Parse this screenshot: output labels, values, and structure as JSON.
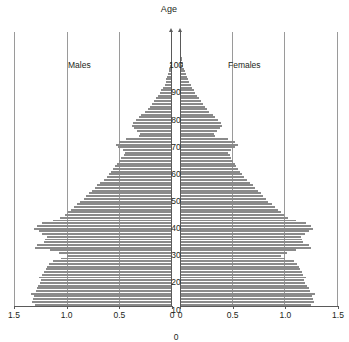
{
  "chart_data": {
    "type": "bar",
    "subtype": "population-pyramid",
    "title": "Age",
    "xlabel": "",
    "ylabel": "Age",
    "grid": true,
    "legend_position": "in-plot",
    "orientation": "horizontal",
    "left_panel_label": "Males",
    "right_panel_label": "Females",
    "xlim_left": [
      1.5,
      0
    ],
    "xlim_right": [
      0,
      1.5
    ],
    "ylim": [
      0,
      100
    ],
    "xticks_left": [
      "1.5",
      "1.0",
      "0.5",
      "0"
    ],
    "xticks_right": [
      "0",
      "0.5",
      "1.0",
      "1.5"
    ],
    "xtick_values_left": [
      1.5,
      1.0,
      0.5,
      0
    ],
    "xtick_values_right": [
      0,
      0.5,
      1.0,
      1.5
    ],
    "yticks": [
      "0",
      "10",
      "20",
      "30",
      "40",
      "50",
      "60",
      "70",
      "80",
      "90",
      "100"
    ],
    "ytick_values": [
      0,
      10,
      20,
      30,
      40,
      50,
      60,
      70,
      80,
      90,
      100
    ],
    "bar_color": "#8a8a8a",
    "axis_color": "#5a5a5a",
    "grid_color": "#9a9a9a",
    "background_color": "#ffffff",
    "ages": [
      0,
      1,
      2,
      3,
      4,
      5,
      6,
      7,
      8,
      9,
      10,
      11,
      12,
      13,
      14,
      15,
      16,
      17,
      18,
      19,
      20,
      21,
      22,
      23,
      24,
      25,
      26,
      27,
      28,
      29,
      30,
      31,
      32,
      33,
      34,
      35,
      36,
      37,
      38,
      39,
      40,
      41,
      42,
      43,
      44,
      45,
      46,
      47,
      48,
      49,
      50,
      51,
      52,
      53,
      54,
      55,
      56,
      57,
      58,
      59,
      60,
      61,
      62,
      63,
      64,
      65,
      66,
      67,
      68,
      69,
      70,
      71,
      72,
      73,
      74,
      75,
      76,
      77,
      78,
      79,
      80,
      81,
      82,
      83,
      84,
      85,
      86,
      87,
      88,
      89,
      90,
      91,
      92,
      93,
      94,
      95,
      96,
      97,
      98,
      99,
      100
    ],
    "series": [
      {
        "name": "Males",
        "side": "left",
        "values": [
          1.3,
          1.33,
          1.32,
          1.31,
          1.34,
          1.29,
          1.28,
          1.27,
          1.25,
          1.24,
          1.26,
          1.23,
          1.22,
          1.2,
          1.19,
          1.17,
          1.13,
          1.05,
          1.0,
          1.07,
          1.16,
          1.3,
          1.28,
          1.22,
          1.21,
          1.19,
          1.23,
          1.26,
          1.31,
          1.28,
          1.23,
          1.13,
          1.06,
          1.02,
          0.99,
          0.96,
          0.93,
          0.9,
          0.87,
          0.84,
          0.82,
          0.79,
          0.76,
          0.73,
          0.71,
          0.68,
          0.65,
          0.62,
          0.6,
          0.58,
          0.56,
          0.54,
          0.52,
          0.5,
          0.48,
          0.46,
          0.45,
          0.47,
          0.51,
          0.53,
          0.5,
          0.44,
          0.31,
          0.3,
          0.33,
          0.36,
          0.38,
          0.37,
          0.34,
          0.31,
          0.29,
          0.26,
          0.23,
          0.21,
          0.19,
          0.17,
          0.15,
          0.13,
          0.11,
          0.1,
          0.09,
          0.07,
          0.06,
          0.055,
          0.05,
          0.04,
          0.03,
          0.025,
          0.02,
          0.015,
          0.012,
          0.01,
          0.008,
          0.006,
          0.005,
          0.004,
          0.003,
          0.002,
          0.002,
          0.001,
          0.001
        ]
      },
      {
        "name": "Females",
        "side": "right",
        "values": [
          1.24,
          1.27,
          1.26,
          1.25,
          1.28,
          1.23,
          1.22,
          1.21,
          1.19,
          1.18,
          1.2,
          1.17,
          1.16,
          1.14,
          1.13,
          1.11,
          1.08,
          1.0,
          0.96,
          1.02,
          1.1,
          1.24,
          1.22,
          1.17,
          1.16,
          1.15,
          1.19,
          1.22,
          1.26,
          1.24,
          1.2,
          1.1,
          1.03,
          0.99,
          0.96,
          0.93,
          0.9,
          0.87,
          0.84,
          0.82,
          0.79,
          0.77,
          0.74,
          0.71,
          0.69,
          0.66,
          0.64,
          0.61,
          0.59,
          0.57,
          0.55,
          0.53,
          0.52,
          0.5,
          0.48,
          0.47,
          0.46,
          0.48,
          0.52,
          0.55,
          0.52,
          0.46,
          0.33,
          0.32,
          0.35,
          0.38,
          0.4,
          0.39,
          0.36,
          0.33,
          0.31,
          0.28,
          0.26,
          0.24,
          0.22,
          0.2,
          0.18,
          0.16,
          0.14,
          0.13,
          0.11,
          0.1,
          0.085,
          0.075,
          0.065,
          0.055,
          0.045,
          0.038,
          0.03,
          0.024,
          0.02,
          0.016,
          0.013,
          0.01,
          0.008,
          0.006,
          0.005,
          0.004,
          0.003,
          0.002,
          0.002
        ]
      }
    ]
  }
}
